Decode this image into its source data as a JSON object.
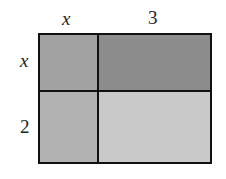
{
  "diagram": {
    "type": "area-model",
    "top_labels": [
      "x",
      "3"
    ],
    "side_labels": [
      "x",
      "2"
    ],
    "cells": [
      {
        "row": 0,
        "col": 0,
        "color": "#a2a2a2"
      },
      {
        "row": 0,
        "col": 1,
        "color": "#8c8c8c"
      },
      {
        "row": 1,
        "col": 0,
        "color": "#b2b2b2"
      },
      {
        "row": 1,
        "col": 1,
        "color": "#c9c9c9"
      }
    ]
  }
}
